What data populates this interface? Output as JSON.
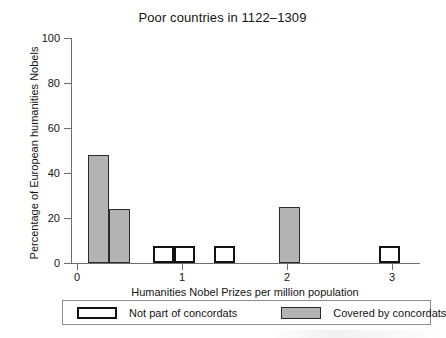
{
  "chart_data": {
    "type": "bar",
    "title": "Poor countries in 1122–1309",
    "xlabel": "Humanities Nobel Prizes per million population",
    "ylabel": "Percentage of European humanities Nobels",
    "xlim": [
      -0.18,
      3.12
    ],
    "ylim": [
      0,
      104
    ],
    "xticks": [
      0,
      1,
      2,
      3
    ],
    "xtick_labels": [
      "0",
      "1",
      "2",
      "3"
    ],
    "yticks": [
      0,
      20,
      40,
      60,
      80,
      100
    ],
    "ytick_labels": [
      "0",
      "20",
      "40",
      "60",
      "80",
      "100"
    ],
    "grid": false,
    "legend_position": "below-axis",
    "bin_width": 0.2,
    "series": [
      {
        "name": "Not part of concordats",
        "style": "hollow",
        "fill_color": "#ffffff",
        "edge_color": "#121212",
        "x": [
          0.72,
          0.92,
          1.3,
          2.88
        ],
        "values": [
          8,
          8,
          8,
          8
        ]
      },
      {
        "name": "Covered by concordats",
        "style": "filled",
        "fill_color": "#b3b3b3",
        "edge_color": "#2b2b2b",
        "x": [
          0.1,
          0.3,
          1.92
        ],
        "values": [
          50,
          25,
          26
        ]
      }
    ]
  },
  "chart": {
    "title": "Poor countries in 1122–1309",
    "x_axis_title": "Humanities Nobel Prizes per million population",
    "y_axis_title": "Percentage of European humanities Nobels",
    "y_tick_labels": [
      "100",
      "80",
      "60",
      "40",
      "20",
      "0"
    ],
    "x_tick_labels": [
      "0",
      "1",
      "2",
      "3"
    ]
  },
  "legend": {
    "items": [
      {
        "label": "Not part of concordats",
        "style": "hollow"
      },
      {
        "label": "Covered by concordats",
        "style": "filled"
      }
    ]
  }
}
